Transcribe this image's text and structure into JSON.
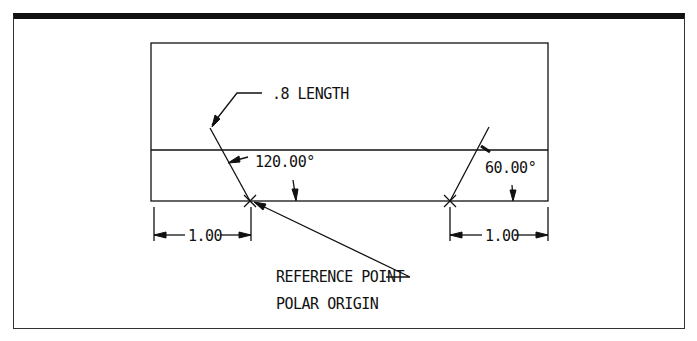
{
  "figure": {
    "type": "technical-drawing",
    "colors": {
      "ink": "#111111",
      "background": "#ffffff"
    }
  },
  "labels": {
    "length": ".8 LENGTH",
    "angle_left": "120.00°",
    "angle_right": "60.00°",
    "dim_left": "1.00",
    "dim_right": "1.00",
    "reference_point": "REFERENCE POINT",
    "polar_origin": "POLAR ORIGIN"
  },
  "geometry": {
    "rectangle": {
      "x": 151,
      "y": 43,
      "width": 397,
      "height": 158
    },
    "mid_line_y": 150,
    "left_origin": {
      "x": 250,
      "y": 201
    },
    "right_origin": {
      "x": 450,
      "y": 201
    },
    "left_line_angle_deg": 120,
    "right_line_angle_deg": 60,
    "line_length_units": 0.8,
    "offset_units": 1.0
  }
}
